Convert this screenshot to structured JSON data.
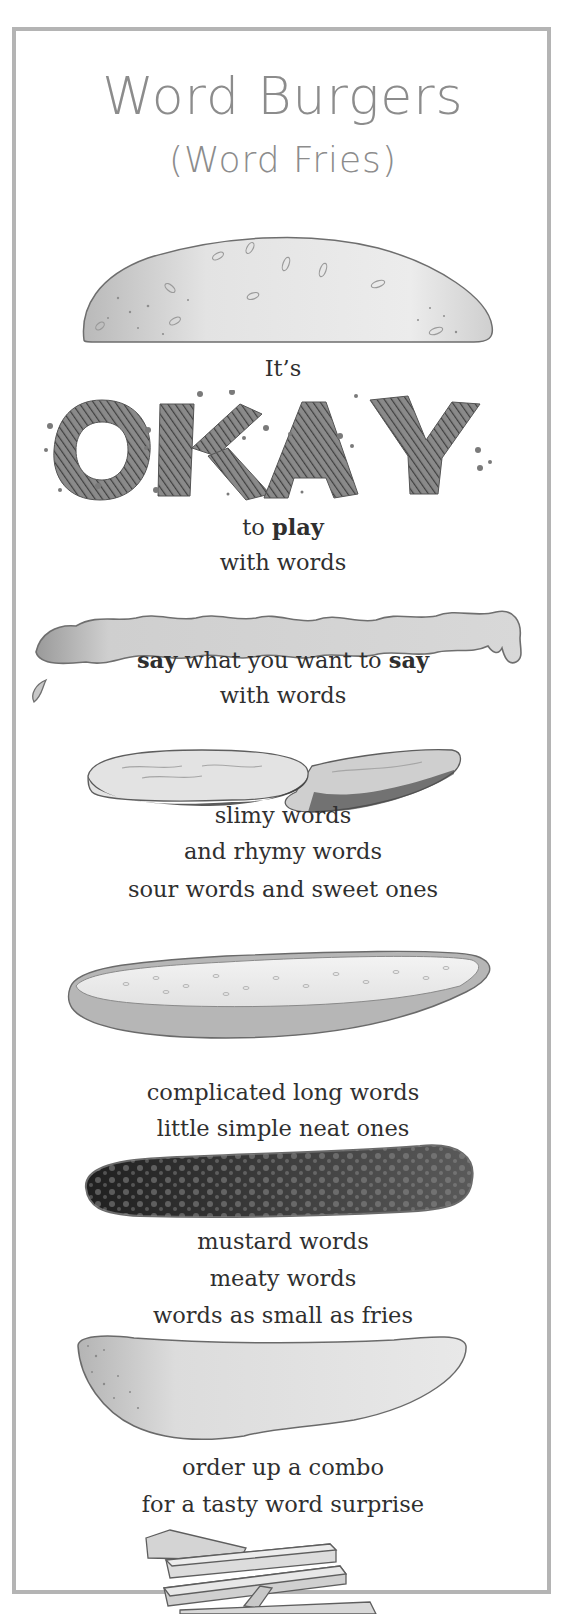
{
  "poem": {
    "title": "Word Burgers",
    "subtitle": "(Word Fries)",
    "lines": {
      "its": "It’s",
      "okay": "OKAY",
      "to": "to ",
      "play": "play",
      "with_words_1": "with words",
      "say_1": "say",
      "say_middle": " what you want to ",
      "say_2": "say",
      "with_words_2": "with words",
      "slimy": "slimy words",
      "rhymy": "and rhymy words",
      "sour": "sour words and sweet ones",
      "complicated": "complicated long words",
      "little": "little simple neat ones",
      "mustard": "mustard words",
      "meaty": "meaty words",
      "small": "words as small as fries",
      "order": "order up a combo",
      "tasty": "for a tasty word surprise"
    }
  },
  "illustrations": [
    {
      "name": "top-bun",
      "label": "top bun"
    },
    {
      "name": "ketchup",
      "label": "ketchup"
    },
    {
      "name": "pickles",
      "label": "pickle slices"
    },
    {
      "name": "cucumber",
      "label": "cucumber slice"
    },
    {
      "name": "patty",
      "label": "meat patty"
    },
    {
      "name": "bottom-bun",
      "label": "bottom bun"
    },
    {
      "name": "fries",
      "label": "french fries"
    }
  ],
  "colors": {
    "frame": "#b4b4b4",
    "title": "#8c8c8c",
    "text": "#2f2f2f"
  }
}
